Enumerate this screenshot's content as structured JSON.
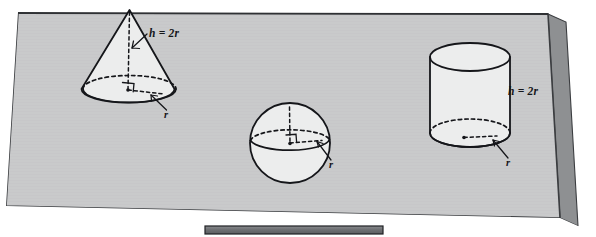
{
  "figure": {
    "caption_fragment_top": "",
    "background_color": "#ffffff",
    "slab": {
      "name": "gray-slab",
      "face_color": "#c9cacb",
      "edge_color": "#3b3d40",
      "shadow_color": "#8e9092",
      "under_sheet_color": "#b5b7b8"
    },
    "bottom_bar": {
      "name": "bottom-gray-bar",
      "fill_color": "#6e7073",
      "border_color": "#1f2124"
    },
    "shapes": [
      {
        "id": "cone",
        "name": "cone-shape",
        "label_height": "h = 2r",
        "label_radius": "r",
        "fill_color": "#eceded",
        "stroke_color": "#15161a"
      },
      {
        "id": "sphere",
        "name": "sphere-shape",
        "label_radius": "r",
        "fill_color": "#eceded",
        "stroke_color": "#15161a"
      },
      {
        "id": "cylinder",
        "name": "cylinder-shape",
        "label_height": "h = 2r",
        "label_radius": "r",
        "fill_color": "#eceded",
        "stroke_color": "#15161a"
      }
    ],
    "labels": {
      "cone_height": "h = 2r",
      "cone_radius": "r",
      "sphere_radius": "r",
      "cylinder_height": "h = 2r",
      "cylinder_radius": "r"
    }
  }
}
